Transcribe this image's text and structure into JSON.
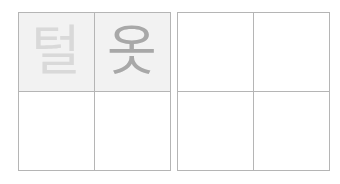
{
  "worksheet": {
    "left_grid": {
      "cells": [
        {
          "char": "털",
          "shade": "faint"
        },
        {
          "char": "옷",
          "shade": "mid"
        },
        {
          "char": ""
        },
        {
          "char": ""
        }
      ]
    },
    "right_grid": {
      "cells": [
        {
          "char": ""
        },
        {
          "char": ""
        },
        {
          "char": ""
        },
        {
          "char": ""
        }
      ]
    },
    "colors": {
      "grid_line": "#b5b5b5",
      "trace_bg": "#f2f2f2",
      "faint_glyph": "#d9d9d9",
      "mid_glyph": "#a8a8a8"
    }
  }
}
